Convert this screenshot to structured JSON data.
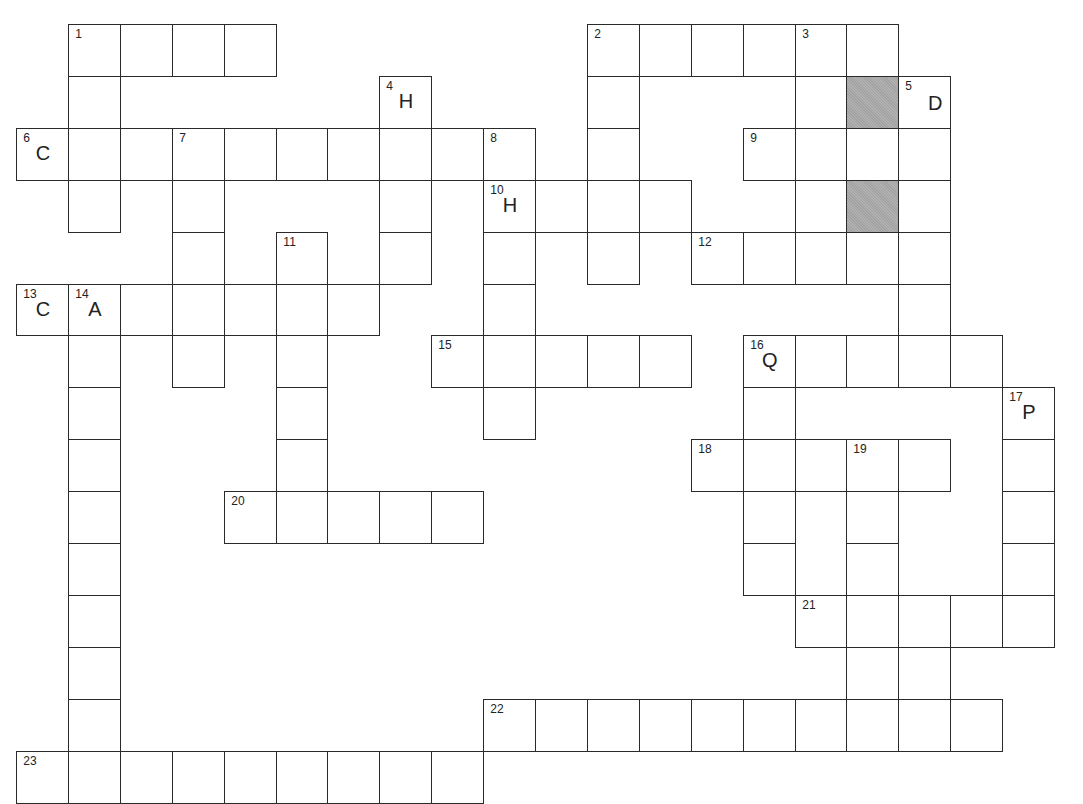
{
  "puzzle": {
    "type": "crossword",
    "cell_size": 51.9,
    "origin": {
      "x": 17,
      "y": 25
    },
    "colors": {
      "line": "#2a2a2a",
      "cell": "#ffffff",
      "shaded": "#a9a9a9"
    },
    "entries": [
      {
        "number": "1",
        "direction": "across",
        "row": 0,
        "col": 1,
        "length": 4
      },
      {
        "number": "1",
        "direction": "down",
        "row": 0,
        "col": 1,
        "length": 4
      },
      {
        "number": "2",
        "direction": "across",
        "row": 0,
        "col": 11,
        "length": 6
      },
      {
        "number": "2",
        "direction": "down",
        "row": 0,
        "col": 11,
        "length": 5
      },
      {
        "number": "3",
        "direction": "down",
        "row": 0,
        "col": 15,
        "length": 5
      },
      {
        "number": "4",
        "direction": "down",
        "row": 1,
        "col": 7,
        "length": 4
      },
      {
        "number": "5",
        "direction": "down",
        "row": 1,
        "col": 17,
        "length": 5
      },
      {
        "number": "6",
        "direction": "across",
        "row": 2,
        "col": 0,
        "length": 10
      },
      {
        "number": "7",
        "direction": "down",
        "row": 2,
        "col": 3,
        "length": 5
      },
      {
        "number": "8",
        "direction": "down",
        "row": 2,
        "col": 9,
        "length": 6
      },
      {
        "number": "9",
        "direction": "across",
        "row": 2,
        "col": 14,
        "length": 4
      },
      {
        "number": "10",
        "direction": "across",
        "row": 3,
        "col": 9,
        "length": 4
      },
      {
        "number": "11",
        "direction": "down",
        "row": 4,
        "col": 5,
        "length": 5
      },
      {
        "number": "12",
        "direction": "across",
        "row": 4,
        "col": 13,
        "length": 5
      },
      {
        "number": "13",
        "direction": "across",
        "row": 5,
        "col": 0,
        "length": 7
      },
      {
        "number": "14",
        "direction": "down",
        "row": 5,
        "col": 1,
        "length": 10
      },
      {
        "number": "15",
        "direction": "across",
        "row": 6,
        "col": 8,
        "length": 5
      },
      {
        "number": "16",
        "direction": "across",
        "row": 6,
        "col": 14,
        "length": 5
      },
      {
        "number": "16",
        "direction": "down",
        "row": 6,
        "col": 14,
        "length": 5
      },
      {
        "number": "17",
        "direction": "down",
        "row": 7,
        "col": 19,
        "length": 5
      },
      {
        "number": "18",
        "direction": "across",
        "row": 8,
        "col": 13,
        "length": 5
      },
      {
        "number": "19",
        "direction": "down",
        "row": 8,
        "col": 16,
        "length": 6
      },
      {
        "number": "20",
        "direction": "across",
        "row": 9,
        "col": 4,
        "length": 5
      },
      {
        "number": "21",
        "direction": "across",
        "row": 11,
        "col": 15,
        "length": 5
      },
      {
        "number": "22",
        "direction": "across",
        "row": 13,
        "col": 9,
        "length": 10
      },
      {
        "number": "23",
        "direction": "across",
        "row": 14,
        "col": 0,
        "length": 9
      }
    ],
    "extra_cells": [
      {
        "row": 1,
        "col": 16,
        "shaded": true
      },
      {
        "row": 3,
        "col": 16,
        "shaded": true
      },
      {
        "row": 12,
        "col": 17
      },
      {
        "row": 13,
        "col": 17
      }
    ],
    "numbers": [
      {
        "row": 0,
        "col": 1,
        "label": "1"
      },
      {
        "row": 0,
        "col": 11,
        "label": "2"
      },
      {
        "row": 0,
        "col": 15,
        "label": "3"
      },
      {
        "row": 1,
        "col": 7,
        "label": "4",
        "letter": "H"
      },
      {
        "row": 1,
        "col": 17,
        "label": "5",
        "letter": "D",
        "letter_align": "right"
      },
      {
        "row": 2,
        "col": 0,
        "label": "6",
        "letter": "C"
      },
      {
        "row": 2,
        "col": 3,
        "label": "7"
      },
      {
        "row": 2,
        "col": 9,
        "label": "8"
      },
      {
        "row": 2,
        "col": 14,
        "label": "9"
      },
      {
        "row": 3,
        "col": 9,
        "label": "10",
        "letter": "H"
      },
      {
        "row": 4,
        "col": 5,
        "label": "11"
      },
      {
        "row": 4,
        "col": 13,
        "label": "12"
      },
      {
        "row": 5,
        "col": 0,
        "label": "13",
        "letter": "C"
      },
      {
        "row": 5,
        "col": 1,
        "label": "14",
        "letter": "A"
      },
      {
        "row": 6,
        "col": 8,
        "label": "15"
      },
      {
        "row": 6,
        "col": 14,
        "label": "16",
        "letter": "Q"
      },
      {
        "row": 7,
        "col": 19,
        "label": "17",
        "letter": "P"
      },
      {
        "row": 8,
        "col": 13,
        "label": "18"
      },
      {
        "row": 8,
        "col": 16,
        "label": "19"
      },
      {
        "row": 9,
        "col": 4,
        "label": "20"
      },
      {
        "row": 11,
        "col": 15,
        "label": "21"
      },
      {
        "row": 13,
        "col": 9,
        "label": "22"
      },
      {
        "row": 14,
        "col": 0,
        "label": "23"
      }
    ]
  }
}
